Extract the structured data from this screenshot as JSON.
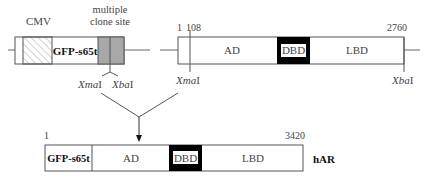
{
  "vector": {
    "promoter_label": "CMV",
    "gfp_label": "GFP-s65t",
    "mcs_label_line1": "multiple",
    "mcs_label_line2": "clone site",
    "site_left": "XmaI",
    "site_left_italic": "Xma",
    "site_left_suffix": "I",
    "site_right": "XbaI",
    "site_right_italic": "Xba",
    "site_right_suffix": "I"
  },
  "insert": {
    "start_label": "1",
    "xma_label": "108",
    "end_label": "2760",
    "domains": [
      {
        "label": "AD"
      },
      {
        "label": "DBD"
      },
      {
        "label": "LBD"
      }
    ],
    "site_left_italic": "Xma",
    "site_left_suffix": "I",
    "site_right_italic": "Xba",
    "site_right_suffix": "I"
  },
  "fusion": {
    "start_label": "1",
    "end_label": "3420",
    "segments": [
      {
        "label": "GFP-s65t"
      },
      {
        "label": "AD"
      },
      {
        "label": "DBD"
      },
      {
        "label": "LBD"
      }
    ],
    "name": "hAR"
  },
  "colors": {
    "outline": "#555555",
    "mcs_fill": "#a8a8a8",
    "dbd_fill": "#000000",
    "hatch": "#888888"
  }
}
